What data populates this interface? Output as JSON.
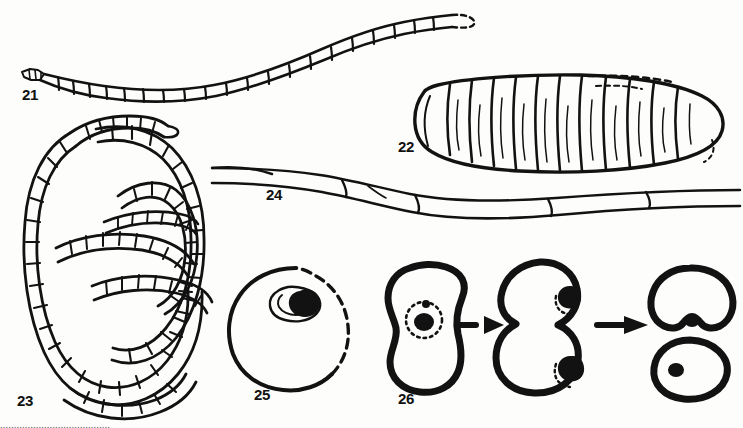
{
  "plate": {
    "title": "Parasitological figure plate 21-26",
    "background_color": "#fdfdfb",
    "ink_color": "#121212",
    "caption_partial": "........................................"
  },
  "figures": [
    {
      "id": "fig-21",
      "label": "21",
      "label_x": 22,
      "label_y": 100,
      "name": "segmented-strobila-extended",
      "description": "Extended segmented tapeworm strobila with tapering scolex at left and dashed terminal proglottid at right"
    },
    {
      "id": "fig-22",
      "label": "22",
      "label_x": 398,
      "label_y": 152,
      "name": "plump-grub-larva",
      "description": "Plump annulated grub larva in lateral view with transverse body segments and dashed dorsal outline"
    },
    {
      "id": "fig-23",
      "label": "23",
      "label_x": 17,
      "label_y": 406,
      "name": "coiled-segmented-worm",
      "description": "Coiled segmented worm arranged in a flat spiral of several whorls"
    },
    {
      "id": "fig-24",
      "label": "24",
      "label_x": 266,
      "label_y": 200,
      "name": "elongate-filamentous-body",
      "description": "Long slender filamentous body with a few elongate cells, spanning the plate width"
    },
    {
      "id": "fig-25",
      "label": "25",
      "label_x": 254,
      "label_y": 400,
      "name": "egg-with-embryo",
      "description": "Rounded egg or cyst with partly dashed shell and a dark embryo enclosed in an inner capsule near the top"
    },
    {
      "id": "fig-26",
      "label": "26",
      "label_x": 398,
      "label_y": 404,
      "name": "cell-division-sequence",
      "description": "Three-stage cell division sequence: uninucleate cell, constricted binucleate stage, and two separated daughter cells"
    }
  ],
  "arrows": [
    {
      "name": "arrow-stage1-to-stage2",
      "style": "dashed",
      "x1": 455,
      "y1": 325,
      "x2": 500,
      "y2": 325
    },
    {
      "name": "arrow-stage2-to-stage3",
      "style": "solid",
      "x1": 597,
      "y1": 325,
      "x2": 645,
      "y2": 325
    }
  ]
}
